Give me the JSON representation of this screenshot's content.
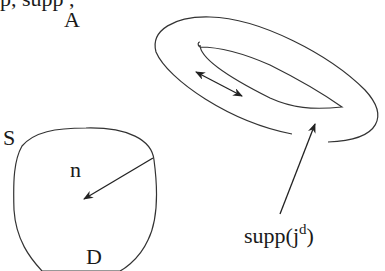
{
  "figure": {
    "cut_top_text": "     p,    supp                        ,",
    "labels": {
      "A": "A",
      "S": "S",
      "n": "n",
      "D": "D",
      "supp_base": "supp(j",
      "supp_sup": "d",
      "supp_close": ")"
    },
    "elements": {
      "region_D": "closed rounded domain D with boundary S",
      "normal_vector": "arrow n from boundary toward interior",
      "ring_A": "toroidal support region A (outer and inner loop)",
      "current_arrow": "double-headed arrow inside ring",
      "pointer_arrow": "arrow from supp(j^d) label into ring"
    },
    "colors": {
      "stroke": "#333333",
      "text": "#1a1a1a",
      "background": "#ffffff"
    }
  }
}
